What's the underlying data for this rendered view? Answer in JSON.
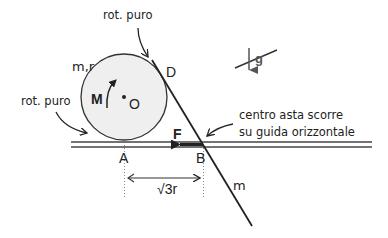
{
  "diagram": {
    "disk": {
      "label": "m,r",
      "center_label": "O",
      "moment_label": "M",
      "fill": "#efefef"
    },
    "rod": {
      "label": "m"
    },
    "points": {
      "A": "A",
      "B": "B",
      "D": "D"
    },
    "force": {
      "label": "F"
    },
    "gravity": {
      "label": "g"
    },
    "distance": {
      "label": "√3r"
    },
    "annotations": {
      "top": "rot. puro",
      "left": "rot. puro",
      "right_line1": "centro asta scorre",
      "right_line2": "su guida orizzontale"
    }
  }
}
